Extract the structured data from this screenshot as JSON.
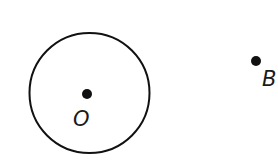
{
  "diagram": {
    "colors": {
      "stroke": "#111111",
      "background": "#ffffff"
    },
    "circle": {
      "cx": 89.5,
      "cy": 93,
      "r": 60,
      "stroke_width": 2
    },
    "points": [
      {
        "id": "O",
        "label": "O",
        "x": 87,
        "y": 94,
        "r": 5,
        "label_x": 73,
        "label_y": 126
      },
      {
        "id": "B",
        "label": "B",
        "x": 256,
        "y": 61,
        "r": 5,
        "label_x": 262,
        "label_y": 86
      }
    ]
  }
}
